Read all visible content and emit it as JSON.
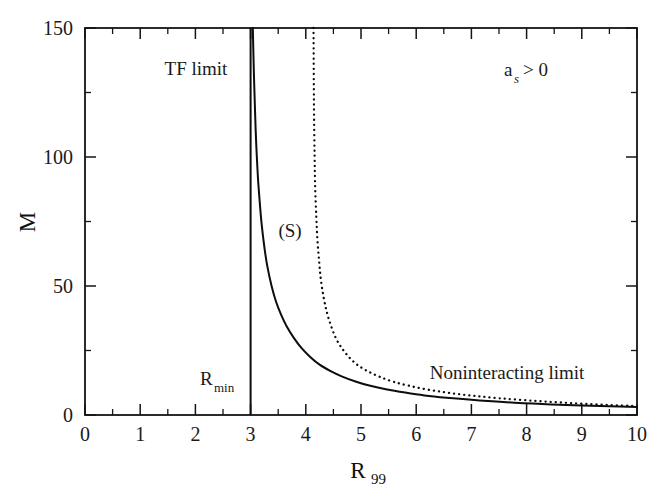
{
  "chart_data": {
    "type": "line",
    "title": "",
    "xlabel": "R_99",
    "xlabel_base": "R",
    "xlabel_sub": "99",
    "ylabel": "M",
    "xlim": [
      0,
      10
    ],
    "ylim": [
      0,
      150
    ],
    "grid": false,
    "legend": "none",
    "x_ticks": [
      "0",
      "1",
      "2",
      "3",
      "4",
      "5",
      "6",
      "7",
      "8",
      "9",
      "10"
    ],
    "x_tick_values": [
      0,
      1,
      2,
      3,
      4,
      5,
      6,
      7,
      8,
      9,
      10
    ],
    "x_minor_ticks": [
      0.5,
      1.5,
      2.5,
      3.5,
      4.5,
      5.5,
      6.5,
      7.5,
      8.5,
      9.5
    ],
    "y_ticks": [
      "0",
      "50",
      "100",
      "150"
    ],
    "y_tick_values": [
      0,
      50,
      100,
      150
    ],
    "y_minor_ticks": [
      25,
      75,
      125
    ],
    "annotations": [
      {
        "name": "tf-limit",
        "text": "TF limit",
        "x": 2.0,
        "y": 135
      },
      {
        "name": "as-positive",
        "text": "a_s > 0",
        "x": 7.8,
        "y": 131
      },
      {
        "name": "s-branch",
        "text": "(S)",
        "x": 3.85,
        "y": 70
      },
      {
        "name": "r-min",
        "text": "R_min",
        "x": 2.72,
        "y": 14
      },
      {
        "name": "noninteracting-limit",
        "text": "Noninteracting limit",
        "x": 7.7,
        "y": 16
      }
    ],
    "vertical_line": {
      "name": "R_min",
      "x": 3.0,
      "label": "R_min",
      "style": "solid"
    },
    "series": [
      {
        "name": "stable-branch-solid",
        "style": "solid",
        "asymptote_x": 3.02,
        "points": [
          [
            3.04,
            150
          ],
          [
            3.06,
            132
          ],
          [
            3.08,
            118
          ],
          [
            3.1,
            106
          ],
          [
            3.13,
            93
          ],
          [
            3.16,
            84
          ],
          [
            3.2,
            74
          ],
          [
            3.25,
            65
          ],
          [
            3.3,
            58
          ],
          [
            3.38,
            50
          ],
          [
            3.46,
            44
          ],
          [
            3.55,
            39
          ],
          [
            3.65,
            34.5
          ],
          [
            3.78,
            30
          ],
          [
            3.92,
            26
          ],
          [
            4.08,
            22.5
          ],
          [
            4.25,
            19.5
          ],
          [
            4.45,
            17
          ],
          [
            4.65,
            15
          ],
          [
            4.9,
            13
          ],
          [
            5.15,
            11.4
          ],
          [
            5.45,
            10
          ],
          [
            5.8,
            8.7
          ],
          [
            6.15,
            7.6
          ],
          [
            6.55,
            6.7
          ],
          [
            7.0,
            5.9
          ],
          [
            7.45,
            5.2
          ],
          [
            7.95,
            4.6
          ],
          [
            8.45,
            4.1
          ],
          [
            9.0,
            3.7
          ],
          [
            9.5,
            3.4
          ],
          [
            10.0,
            3.1
          ]
        ]
      },
      {
        "name": "unstable-branch-dotted",
        "style": "dotted",
        "asymptote_x": 4.13,
        "points": [
          [
            4.14,
            150
          ],
          [
            4.145,
            130
          ],
          [
            4.15,
            115
          ],
          [
            4.16,
            100
          ],
          [
            4.17,
            88
          ],
          [
            4.19,
            77
          ],
          [
            4.21,
            68
          ],
          [
            4.24,
            60
          ],
          [
            4.27,
            53
          ],
          [
            4.32,
            46
          ],
          [
            4.38,
            40
          ],
          [
            4.45,
            35
          ],
          [
            4.54,
            30
          ],
          [
            4.65,
            26
          ],
          [
            4.78,
            22.5
          ],
          [
            4.93,
            19.5
          ],
          [
            5.12,
            17
          ],
          [
            5.34,
            14.8
          ],
          [
            5.6,
            12.8
          ],
          [
            5.9,
            11.2
          ],
          [
            6.25,
            9.7
          ],
          [
            6.62,
            8.5
          ],
          [
            7.05,
            7.4
          ],
          [
            7.5,
            6.5
          ],
          [
            8.0,
            5.7
          ],
          [
            8.5,
            5.0
          ],
          [
            9.0,
            4.4
          ],
          [
            9.5,
            3.9
          ],
          [
            10.0,
            3.4
          ]
        ]
      }
    ]
  },
  "figure": {
    "y_axis_title": "M",
    "x_axis_title_base": "R",
    "x_axis_title_sub": "99",
    "annot_tf": "TF limit",
    "annot_as_base": "a",
    "annot_as_sub": "s",
    "annot_as_rel": "> 0",
    "annot_s": "(S)",
    "annot_rmin_base": "R",
    "annot_rmin_sub": "min",
    "annot_noninteracting": "Noninteracting limit",
    "tick_0": "0",
    "tick_1": "1",
    "tick_2": "2",
    "tick_3": "3",
    "tick_4": "4",
    "tick_5": "5",
    "tick_6": "6",
    "tick_7": "7",
    "tick_8": "8",
    "tick_9": "9",
    "tick_10": "10",
    "ytick_0": "0",
    "ytick_50": "50",
    "ytick_100": "100",
    "ytick_150": "150"
  },
  "colors": {
    "curve": "#0d0d0d",
    "frame": "#141414",
    "text": "#1a1a1a",
    "background": "#ffffff"
  }
}
